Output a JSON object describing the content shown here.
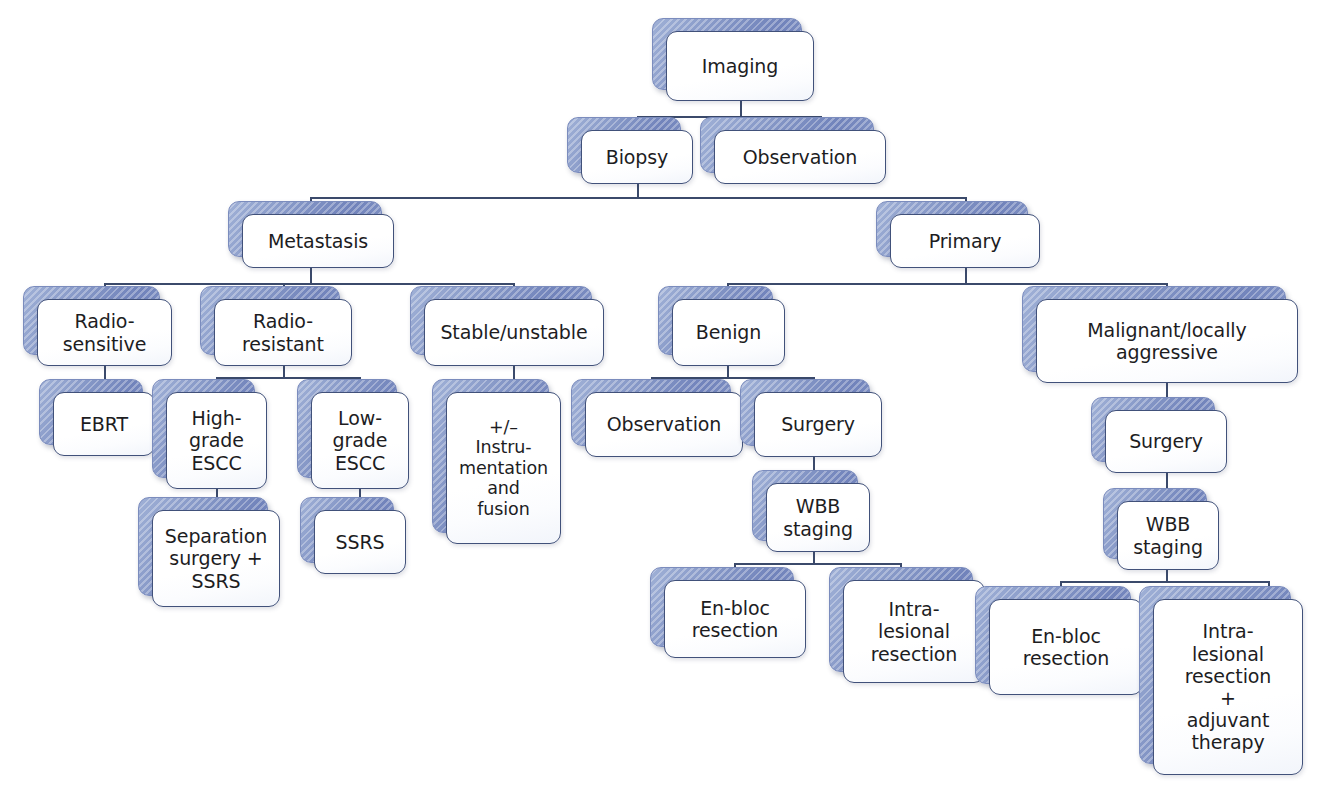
{
  "diagram": {
    "type": "flowchart",
    "background_color": "#ffffff",
    "box_fill_color": "#ffffff",
    "box_border_color": "#41517a",
    "shadow_plate_color": "#8193c4",
    "text_color": "#1d1d1f",
    "connector_color": "#3b4a6b"
  },
  "nodes": {
    "imaging": {
      "label": "Imaging"
    },
    "biopsy": {
      "label": "Biopsy"
    },
    "observation_top": {
      "label": "Observation"
    },
    "metastasis": {
      "label": "Metastasis"
    },
    "primary": {
      "label": "Primary"
    },
    "radio_sensitive": {
      "label": "Radio-\nsensitive"
    },
    "radio_resistant": {
      "label": "Radio-\nresistant"
    },
    "stable_unstable": {
      "label": "Stable/unstable"
    },
    "benign": {
      "label": "Benign"
    },
    "malignant": {
      "label": "Malignant/locally\naggressive"
    },
    "ebrt": {
      "label": "EBRT"
    },
    "high_grade_escc": {
      "label": "High-\ngrade\nESCC"
    },
    "low_grade_escc": {
      "label": "Low-\ngrade\nESCC"
    },
    "instrumentation": {
      "label": "+/–\nInstru-\nmentation\nand\nfusion"
    },
    "observation_benign": {
      "label": "Observation"
    },
    "surgery_benign": {
      "label": "Surgery"
    },
    "surgery_malignant": {
      "label": "Surgery"
    },
    "separation_surgery": {
      "label": "Separation\nsurgery +\nSSRS"
    },
    "ssrs": {
      "label": "SSRS"
    },
    "wbb_benign": {
      "label": "WBB\nstaging"
    },
    "wbb_malignant": {
      "label": "WBB\nstaging"
    },
    "enbloc_benign": {
      "label": "En-bloc\nresection"
    },
    "intralesional_benign": {
      "label": "Intra-\nlesional\nresection"
    },
    "enbloc_malignant": {
      "label": "En-bloc\nresection"
    },
    "intralesional_malignant": {
      "label": "Intra-\nlesional\nresection\n+\nadjuvant\ntherapy"
    }
  },
  "edges": [
    {
      "from": "imaging",
      "to": "biopsy"
    },
    {
      "from": "imaging",
      "to": "observation_top"
    },
    {
      "from": "biopsy",
      "to": "metastasis"
    },
    {
      "from": "biopsy",
      "to": "primary"
    },
    {
      "from": "metastasis",
      "to": "radio_sensitive"
    },
    {
      "from": "metastasis",
      "to": "radio_resistant"
    },
    {
      "from": "metastasis",
      "to": "stable_unstable"
    },
    {
      "from": "primary",
      "to": "benign"
    },
    {
      "from": "primary",
      "to": "malignant"
    },
    {
      "from": "radio_sensitive",
      "to": "ebrt"
    },
    {
      "from": "radio_resistant",
      "to": "high_grade_escc"
    },
    {
      "from": "radio_resistant",
      "to": "low_grade_escc"
    },
    {
      "from": "stable_unstable",
      "to": "instrumentation"
    },
    {
      "from": "high_grade_escc",
      "to": "separation_surgery"
    },
    {
      "from": "low_grade_escc",
      "to": "ssrs"
    },
    {
      "from": "benign",
      "to": "observation_benign"
    },
    {
      "from": "benign",
      "to": "surgery_benign"
    },
    {
      "from": "surgery_benign",
      "to": "wbb_benign"
    },
    {
      "from": "wbb_benign",
      "to": "enbloc_benign"
    },
    {
      "from": "wbb_benign",
      "to": "intralesional_benign"
    },
    {
      "from": "malignant",
      "to": "surgery_malignant"
    },
    {
      "from": "surgery_malignant",
      "to": "wbb_malignant"
    },
    {
      "from": "wbb_malignant",
      "to": "enbloc_malignant"
    },
    {
      "from": "wbb_malignant",
      "to": "intralesional_malignant"
    }
  ]
}
